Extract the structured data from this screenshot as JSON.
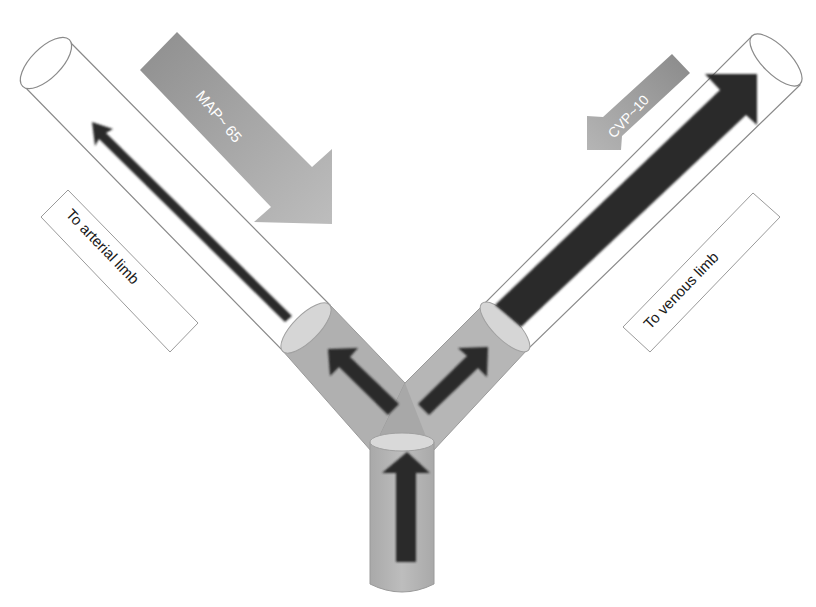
{
  "diagram": {
    "type": "flow-schematic",
    "labels": {
      "map_arrow": "MAP~ 65",
      "cvp_arrow": "CVP~10",
      "arterial_box": "To arterial limb",
      "venous_box": "To venous limb"
    },
    "colors": {
      "background": "#ffffff",
      "tube_outline": "#8a8a8a",
      "tube_fill": "#ffffff",
      "grey_section": "#b3b3b3",
      "ellipse_fill": "#d9d9d9",
      "flow_arrow": "#2b2b2b",
      "pressure_arrow_light": "#b8b8b8",
      "pressure_arrow_dark": "#7d7d7d",
      "pressure_text": "#ffffff",
      "label_text": "#1a1a1a"
    }
  }
}
